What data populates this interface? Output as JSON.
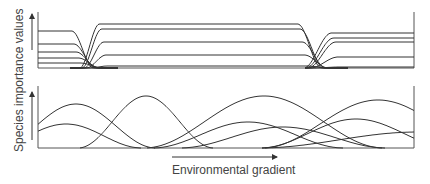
{
  "figure": {
    "y_axis_label": "Species importance values",
    "x_axis_label": "Environmental gradient",
    "panels": [
      {
        "id": "top",
        "description": "Discrete community model: species groups replace one another abruptly along the gradient",
        "frame": {
          "x0": 38,
          "x1": 414,
          "y_top": 12,
          "y_base": 68
        },
        "segments": [
          {
            "x_start": 38,
            "x_end": 88,
            "levels_y": [
              31,
              44,
              52,
              58,
              63
            ]
          },
          {
            "x_start": 100,
            "x_end": 318,
            "levels_y": [
              24,
              29,
              42,
              55,
              66
            ]
          },
          {
            "x_start": 335,
            "x_end": 414,
            "levels_y": [
              33,
              38,
              42,
              57,
              67
            ]
          }
        ],
        "transitions": [
          {
            "fall_start": 76,
            "fall_end": 98,
            "rise_start": 84,
            "rise_end": 104
          },
          {
            "fall_start": 302,
            "fall_end": 326,
            "rise_start": 308,
            "rise_end": 336
          }
        ]
      },
      {
        "id": "bottom",
        "description": "Continuum model: species distributions overlap independently along the gradient",
        "frame": {
          "x0": 38,
          "x1": 414,
          "y_top": 86,
          "y_base": 148
        },
        "curves": [
          {
            "center": 30,
            "width": 40,
            "peak_y": 104
          },
          {
            "center": 20,
            "width": 38,
            "peak_y": 124
          },
          {
            "center": 108,
            "width": 34,
            "peak_y": 96
          },
          {
            "center": 226,
            "width": 60,
            "peak_y": 96
          },
          {
            "center": 210,
            "width": 48,
            "peak_y": 122
          },
          {
            "center": 245,
            "width": 52,
            "peak_y": 127
          },
          {
            "center": 340,
            "width": 58,
            "peak_y": 100
          },
          {
            "center": 318,
            "width": 48,
            "peak_y": 119
          },
          {
            "center": 430,
            "width": 26,
            "peak_y": 108
          },
          {
            "center": 380,
            "width": 80,
            "peak_y": 132
          }
        ]
      }
    ],
    "colors": {
      "line": "#333333",
      "axis": "#555555",
      "text": "#444444"
    }
  }
}
